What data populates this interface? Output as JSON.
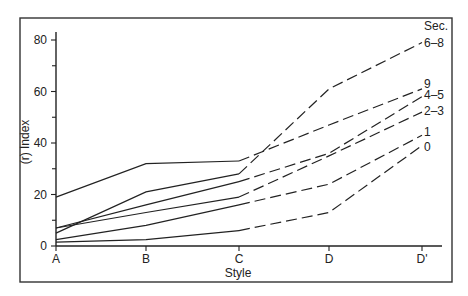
{
  "chart_data": {
    "type": "line",
    "title": "",
    "xlabel": "Style",
    "ylabel": "(r) Index",
    "categories": [
      "A",
      "B",
      "C",
      "D",
      "D'"
    ],
    "ylim": [
      0,
      85
    ],
    "yticks": [
      0,
      20,
      40,
      60,
      80
    ],
    "yminor_ticks": [
      10,
      30,
      50,
      70
    ],
    "grid": false,
    "legend": {
      "title": "Sec.",
      "position": "right, at line ends"
    },
    "line_style_note": "Solid segments from A to C, dashed segments from C to D'",
    "series": [
      {
        "name": "9",
        "values": [
          19,
          32,
          33,
          47,
          61
        ]
      },
      {
        "name": "6-8",
        "values": [
          5,
          21,
          28,
          61,
          79
        ]
      },
      {
        "name": "4-5",
        "values": [
          7,
          16,
          25,
          36,
          58
        ]
      },
      {
        "name": "2-3",
        "values": [
          7,
          13,
          19,
          35,
          52
        ]
      },
      {
        "name": "1",
        "values": [
          2.5,
          8,
          16,
          24,
          43
        ]
      },
      {
        "name": "0",
        "values": [
          1.5,
          2.5,
          6,
          13,
          39
        ]
      }
    ]
  },
  "labels": {
    "legend_title": "Sec.",
    "xlabel": "Style",
    "ylabel": "(r) Index"
  }
}
